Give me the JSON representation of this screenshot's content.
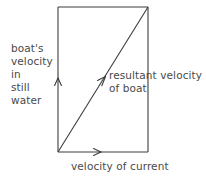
{
  "diagram": {
    "background_color": "#ffffff",
    "line_color": "#3c3c3c",
    "text_color": "#4a4a4a",
    "labels": {
      "boat_velocity": "boat's\nvelocity\nin\nstill\nwater",
      "resultant_velocity": "resultant velocity\nof boat",
      "velocity_of_current": "velocity of current"
    },
    "geometry": {
      "rect_left": 58,
      "rect_top": 7,
      "rect_right": 148,
      "rect_bottom": 152,
      "diagonal_from": [
        58,
        152
      ],
      "diagonal_to": [
        148,
        7
      ],
      "arrow_up_at": [
        58,
        78
      ],
      "arrow_right_at": [
        100,
        152
      ],
      "arrow_diagonal_at": [
        105,
        78
      ]
    },
    "vectors": [
      {
        "name": "boat-velocity-vector",
        "direction": "up",
        "label": "boat's velocity in still water"
      },
      {
        "name": "current-velocity-vector",
        "direction": "right",
        "label": "velocity of current"
      },
      {
        "name": "resultant-velocity-vector",
        "direction": "up-right",
        "label": "resultant velocity of boat"
      }
    ]
  }
}
